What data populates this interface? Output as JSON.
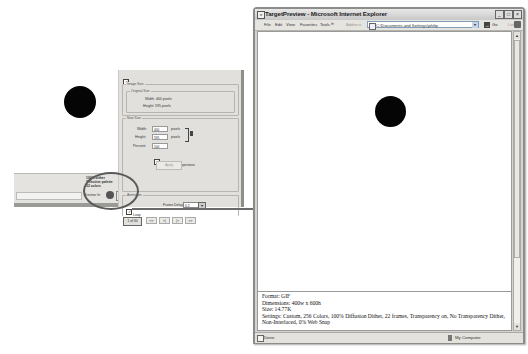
{
  "photoshop_panel": {
    "animate_label": "Animate",
    "animate_checked": true,
    "image_size_group": "Image Size",
    "original_size_group": "Original Size",
    "original_width": "Width: 400 pixels",
    "original_height": "Height: 595 pixels",
    "new_size_group": "New Size",
    "width_label": "Width:",
    "width_value": "400",
    "height_label": "Height:",
    "height_value": "595",
    "percent_label": "Percent:",
    "percent_value": "100",
    "unit_pixels": "pixels",
    "constrain_label": "Constrain Proportions",
    "constrain_checked": true,
    "apply_label": "Apply",
    "animation_group": "Animation",
    "loop_label": "Loop",
    "loop_checked": true,
    "frame_delay_label": "Frame Delay:",
    "frame_delay_value": "0.2",
    "frame_counter": "1 of 30",
    "nav_buttons": [
      "<<",
      "<|",
      "|>",
      ">>"
    ],
    "status_info": [
      "100% dither",
      "Selective palette",
      "32 colors"
    ],
    "preview_in_label": "Preview In:",
    "preview_browser_icon": "browser-icon",
    "preview_dropdown_icon": "chevron-down-icon"
  },
  "annotation": {
    "highlight": "preview-in-browser-button",
    "arrow_direction": "right"
  },
  "browser": {
    "title": "TargetPreview - Microsoft Internet Explorer",
    "menu": [
      "File",
      "Edit",
      "View",
      "Favorites",
      "Tools"
    ],
    "menu_overflow": "»",
    "address_label": "Address",
    "address_value": "C:\\Documents and Settings\\philip",
    "go_label": "Go",
    "links_label": "Links",
    "links_overflow": "»",
    "window_buttons": [
      "_",
      "□",
      "×"
    ],
    "info": {
      "format": "Format: GIF",
      "dimensions": "Dimensions: 400w x 600h",
      "size": "Size: 14.77K",
      "settings": "Settings: Custom, 256 Colors, 100% Diffusion Dither, 22 frames, Transparency on, No Transparency Dither, Non-Interlaced, 0% Web Snap"
    },
    "status_text": "Done",
    "status_zone": "My Computer",
    "scroll_up": "▲",
    "scroll_down": "▼"
  }
}
